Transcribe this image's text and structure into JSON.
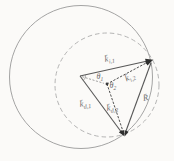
{
  "figure": {
    "type": "wave-vector k-space diagram (Ewald-sphere construction)",
    "background": "#fbfaf8",
    "colors": {
      "circle_solid": "#9a9a9a",
      "circle_dashed": "#ababab",
      "vector_line": "#585858",
      "dotted_line": "#4f4f4f",
      "center_line": "#8a8a8a",
      "arrowhead": "#2e2e2e",
      "angle_arc": "#7a7a7a",
      "dot": "#3a3a3a",
      "label_text": "#6b6b6b"
    },
    "labels": {
      "k_i1": {
        "base": "k̄",
        "sub": "i,1"
      },
      "k_i2": {
        "base": "k̄",
        "sub": "i,2"
      },
      "k_d1": {
        "base": "k̄",
        "sub": "d,1"
      },
      "k_d2": {
        "base": "k̄",
        "sub": "d,2"
      },
      "R": {
        "base": "R̄",
        "sub": ""
      },
      "theta1": {
        "base": "θ",
        "sub": "1"
      },
      "theta2": {
        "base": "θ",
        "sub": "2"
      }
    }
  }
}
